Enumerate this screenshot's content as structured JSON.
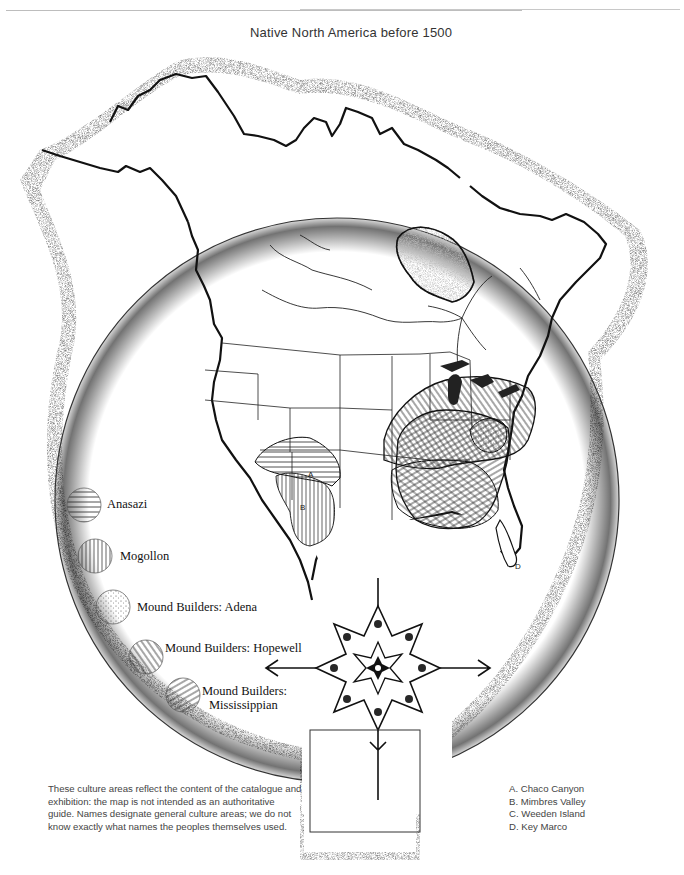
{
  "title": "Native North America before 1500",
  "legend": [
    {
      "id": "anasazi",
      "label": "Anasazi",
      "pattern": "horizontal-lines"
    },
    {
      "id": "mogollon",
      "label": "Mogollon",
      "pattern": "vertical-lines"
    },
    {
      "id": "adena",
      "label": "Mound Builders: Adena",
      "pattern": "stipple-dots"
    },
    {
      "id": "hopewell",
      "label": "Mound Builders: Hopewell",
      "pattern": "diagonal-lines-steep"
    },
    {
      "id": "mississippian",
      "label_line1": "Mound Builders:",
      "label_line2": "Mississippian",
      "pattern": "diagonal-lines-shallow"
    }
  ],
  "map_labels": {
    "A": "A",
    "B": "B",
    "D": "D"
  },
  "note": "These culture areas reflect the content of the catalogue and exhibition: the map is not intended as an authoritative guide. Names designate general culture areas; we do not know exactly what names the peoples themselves used.",
  "sites": [
    {
      "letter": "A",
      "text": "A. Chaco Canyon"
    },
    {
      "letter": "B",
      "text": "B. Mimbres Valley"
    },
    {
      "letter": "C",
      "text": "C. Weeden Island"
    },
    {
      "letter": "D",
      "text": "D. Key Marco"
    }
  ],
  "colors": {
    "ink": "#111111",
    "paper": "#ffffff",
    "stipple": "#555555"
  }
}
